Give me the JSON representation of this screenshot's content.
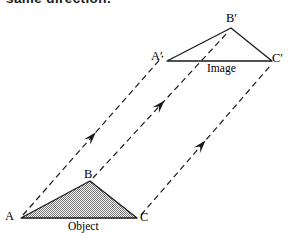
{
  "figure": {
    "caption_top": "same direction.",
    "background_color": "#ffffff",
    "line_color": "#1a1a1a",
    "object_fill_color": "#8c8c8c",
    "width": 289,
    "height": 233
  },
  "object_shape": {
    "name": "Object",
    "label": "Object",
    "label_pos": {
      "x": 68,
      "y": 221
    },
    "vertices": [
      {
        "id": "A",
        "label": "A",
        "x": 21,
        "y": 218,
        "label_pos": {
          "x": 5,
          "y": 210
        }
      },
      {
        "id": "B",
        "label": "B",
        "x": 90,
        "y": 181,
        "label_pos": {
          "x": 84,
          "y": 168
        }
      },
      {
        "id": "C",
        "label": "C",
        "x": 137,
        "y": 218,
        "label_pos": {
          "x": 140,
          "y": 211
        }
      }
    ]
  },
  "image_shape": {
    "name": "Image",
    "label": "Image",
    "label_pos": {
      "x": 207,
      "y": 63
    },
    "vertices": [
      {
        "id": "A'",
        "label": "A′",
        "x": 167,
        "y": 61,
        "label_pos": {
          "x": 151,
          "y": 50
        }
      },
      {
        "id": "B'",
        "label": "B′",
        "x": 231,
        "y": 28,
        "label_pos": {
          "x": 226,
          "y": 12
        }
      },
      {
        "id": "C'",
        "label": "C′",
        "x": 272,
        "y": 61,
        "label_pos": {
          "x": 272,
          "y": 52
        }
      }
    ]
  },
  "translation_vectors": [
    {
      "id": "vector-a",
      "from": "A",
      "to": "A'",
      "x1": 23,
      "y1": 215,
      "x2": 163,
      "y2": 56,
      "arrow_t": 0.52
    },
    {
      "id": "vector-b",
      "from": "B",
      "to": "B'",
      "x1": 93,
      "y1": 178,
      "x2": 228,
      "y2": 32,
      "arrow_t": 0.53
    },
    {
      "id": "vector-c",
      "from": "C",
      "to": "C'",
      "x1": 141,
      "y1": 215,
      "x2": 270,
      "y2": 66,
      "arrow_t": 0.5
    }
  ]
}
